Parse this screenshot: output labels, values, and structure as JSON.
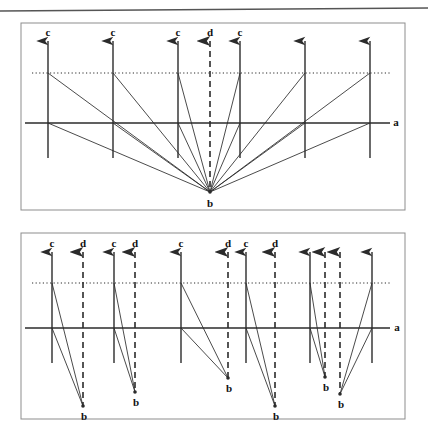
{
  "figure": {
    "background": "#ffffff",
    "ink_color": "#2b2b2b",
    "label_color": "#111111",
    "width": 429,
    "height": 447
  },
  "top_rule": {
    "name": "page-top-rule",
    "x1": 0,
    "y1": 11,
    "x2": 428,
    "y2": 8,
    "stroke_width": 1.6
  },
  "panels": [
    {
      "id": "panel-top",
      "frame": {
        "x": 21,
        "y": 23,
        "width": 384,
        "height": 187
      },
      "axis": {
        "label": "a",
        "label_x": 396,
        "label_y": 126,
        "y": 123,
        "x1": 25,
        "x2": 390
      },
      "dotted_line": {
        "label": "",
        "y": 73,
        "x1": 32,
        "x2": 392
      },
      "convergence": {
        "label": "b",
        "x": 210,
        "y": 192,
        "label_x": 210,
        "label_y": 207
      },
      "verticals": [
        {
          "label": "c",
          "x": 48,
          "top": 41,
          "bottom": 158,
          "style": "solid",
          "label_y": 36
        },
        {
          "label": "c",
          "x": 113,
          "top": 41,
          "bottom": 158,
          "style": "solid",
          "label_y": 36
        },
        {
          "label": "c",
          "x": 178,
          "top": 41,
          "bottom": 158,
          "style": "solid",
          "label_y": 36
        },
        {
          "label": "d",
          "x": 210,
          "top": 41,
          "bottom": 192,
          "style": "dashed",
          "label_y": 36
        },
        {
          "label": "c",
          "x": 240,
          "top": 41,
          "bottom": 158,
          "style": "solid",
          "label_y": 36
        },
        {
          "label": "",
          "x": 305,
          "top": 41,
          "bottom": 158,
          "style": "solid",
          "label_y": 36
        },
        {
          "label": "",
          "x": 370,
          "top": 41,
          "bottom": 158,
          "style": "solid",
          "label_y": 36
        }
      ],
      "rays": [
        {
          "from_x": 48,
          "from_y": 73,
          "to_x": 210,
          "to_y": 192
        },
        {
          "from_x": 48,
          "from_y": 123,
          "to_x": 210,
          "to_y": 192
        },
        {
          "from_x": 113,
          "from_y": 73,
          "to_x": 210,
          "to_y": 192
        },
        {
          "from_x": 113,
          "from_y": 123,
          "to_x": 210,
          "to_y": 192
        },
        {
          "from_x": 178,
          "from_y": 73,
          "to_x": 210,
          "to_y": 192
        },
        {
          "from_x": 178,
          "from_y": 123,
          "to_x": 210,
          "to_y": 192
        },
        {
          "from_x": 240,
          "from_y": 73,
          "to_x": 210,
          "to_y": 192
        },
        {
          "from_x": 240,
          "from_y": 123,
          "to_x": 210,
          "to_y": 192
        },
        {
          "from_x": 305,
          "from_y": 73,
          "to_x": 210,
          "to_y": 192
        },
        {
          "from_x": 305,
          "from_y": 123,
          "to_x": 210,
          "to_y": 192
        },
        {
          "from_x": 370,
          "from_y": 73,
          "to_x": 210,
          "to_y": 192
        },
        {
          "from_x": 370,
          "from_y": 123,
          "to_x": 210,
          "to_y": 192
        }
      ]
    },
    {
      "id": "panel-bottom",
      "frame": {
        "x": 21,
        "y": 233,
        "width": 384,
        "height": 186
      },
      "axis": {
        "label": "a",
        "label_x": 397,
        "label_y": 331,
        "y": 328,
        "x1": 25,
        "x2": 390
      },
      "dotted_line": {
        "label": "",
        "y": 283,
        "x1": 32,
        "x2": 392
      },
      "verticals": [
        {
          "label": "c",
          "x": 52,
          "top": 252,
          "bottom": 363,
          "style": "solid",
          "label_y": 247
        },
        {
          "label": "d",
          "x": 83,
          "top": 252,
          "bottom": 406,
          "style": "dashed",
          "label_y": 247
        },
        {
          "label": "c",
          "x": 114,
          "top": 252,
          "bottom": 363,
          "style": "solid",
          "label_y": 247
        },
        {
          "label": "d",
          "x": 135,
          "top": 252,
          "bottom": 392,
          "style": "dashed",
          "label_y": 247
        },
        {
          "label": "c",
          "x": 181,
          "top": 252,
          "bottom": 363,
          "style": "solid",
          "label_y": 247
        },
        {
          "label": "d",
          "x": 228,
          "top": 252,
          "bottom": 378,
          "style": "dashed",
          "label_y": 247
        },
        {
          "label": "c",
          "x": 246,
          "top": 252,
          "bottom": 363,
          "style": "solid",
          "label_y": 247
        },
        {
          "label": "d",
          "x": 275,
          "top": 252,
          "bottom": 406,
          "style": "dashed",
          "label_y": 247
        },
        {
          "label": "",
          "x": 310,
          "top": 252,
          "bottom": 363,
          "style": "solid",
          "label_y": 247
        },
        {
          "label": "",
          "x": 325,
          "top": 252,
          "bottom": 377,
          "style": "dashed",
          "label_y": 247
        },
        {
          "label": "",
          "x": 340,
          "top": 252,
          "bottom": 394,
          "style": "dashed",
          "label_y": 247
        },
        {
          "label": "",
          "x": 372,
          "top": 252,
          "bottom": 363,
          "style": "solid",
          "label_y": 247
        }
      ],
      "convergences": [
        {
          "label": "b",
          "x": 83,
          "y": 406,
          "label_x": 84,
          "label_y": 420
        },
        {
          "label": "b",
          "x": 135,
          "y": 392,
          "label_x": 136,
          "label_y": 406
        },
        {
          "label": "b",
          "x": 228,
          "y": 378,
          "label_x": 229,
          "label_y": 392
        },
        {
          "label": "b",
          "x": 275,
          "y": 406,
          "label_x": 276,
          "label_y": 420
        },
        {
          "label": "b",
          "x": 325,
          "y": 377,
          "label_x": 326,
          "label_y": 391
        },
        {
          "label": "b",
          "x": 340,
          "y": 394,
          "label_x": 341,
          "label_y": 408
        }
      ],
      "rays": [
        {
          "from_x": 52,
          "from_y": 283,
          "to_x": 83,
          "to_y": 406
        },
        {
          "from_x": 52,
          "from_y": 328,
          "to_x": 83,
          "to_y": 406
        },
        {
          "from_x": 114,
          "from_y": 283,
          "to_x": 135,
          "to_y": 392
        },
        {
          "from_x": 114,
          "from_y": 328,
          "to_x": 135,
          "to_y": 392
        },
        {
          "from_x": 181,
          "from_y": 283,
          "to_x": 228,
          "to_y": 378
        },
        {
          "from_x": 181,
          "from_y": 328,
          "to_x": 228,
          "to_y": 378
        },
        {
          "from_x": 246,
          "from_y": 283,
          "to_x": 275,
          "to_y": 406
        },
        {
          "from_x": 246,
          "from_y": 328,
          "to_x": 275,
          "to_y": 406
        },
        {
          "from_x": 310,
          "from_y": 283,
          "to_x": 325,
          "to_y": 377
        },
        {
          "from_x": 310,
          "from_y": 328,
          "to_x": 325,
          "to_y": 377
        },
        {
          "from_x": 372,
          "from_y": 283,
          "to_x": 340,
          "to_y": 394
        },
        {
          "from_x": 372,
          "from_y": 328,
          "to_x": 340,
          "to_y": 394
        }
      ]
    }
  ]
}
